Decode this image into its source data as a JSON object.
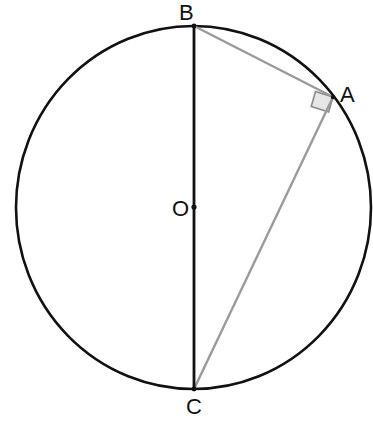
{
  "diagram": {
    "circle": {
      "center_label": "O",
      "cx": 193.5,
      "cy": 207.5,
      "rx": 177.5,
      "ry": 181.5,
      "stroke": "#111111"
    },
    "points": {
      "B": {
        "label": "B",
        "x": 194,
        "y": 26
      },
      "A": {
        "label": "A",
        "x": 333,
        "y": 97
      },
      "O": {
        "label": "O",
        "x": 194,
        "y": 207
      },
      "C": {
        "label": "C",
        "x": 194,
        "y": 389
      }
    },
    "segments": [
      {
        "from": "B",
        "to": "C",
        "color": "#111111",
        "role": "diameter"
      },
      {
        "from": "B",
        "to": "A",
        "color": "#9a9a9a",
        "role": "chord"
      },
      {
        "from": "A",
        "to": "C",
        "color": "#9a9a9a",
        "role": "chord"
      }
    ],
    "right_angle_marker": {
      "at": "A",
      "fill": "#e6e6e6",
      "stroke": "#8a8a8a"
    }
  }
}
